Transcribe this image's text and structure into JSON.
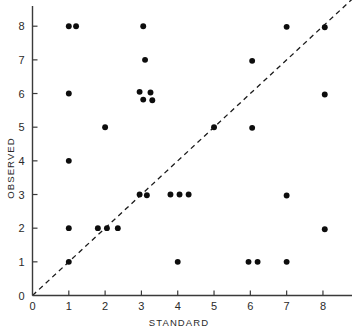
{
  "chart_data": {
    "type": "scatter",
    "title": "",
    "xlabel": "STANDARD",
    "ylabel": "OBSERVED",
    "xlim": [
      0,
      8.8
    ],
    "ylim": [
      0,
      8.6
    ],
    "xticks": [
      0,
      1,
      2,
      3,
      4,
      5,
      6,
      7,
      8
    ],
    "yticks": [
      0,
      1,
      2,
      3,
      4,
      5,
      6,
      7,
      8
    ],
    "xtick_labels": [
      "0",
      "1",
      "2",
      "3",
      "4",
      "5",
      "6",
      "7",
      "8"
    ],
    "ytick_labels": [
      "0",
      "1",
      "2",
      "3",
      "4",
      "5",
      "6",
      "7",
      "8"
    ],
    "grid": false,
    "legend": false,
    "marker": "filled-circle",
    "marker_color": "#0d0d0d",
    "marker_size": 5,
    "note": "points are jittered slightly to reveal overlapping observations",
    "reference_line": {
      "name": "identity-line",
      "style": "dashed",
      "color": "#1a1a1a",
      "from": [
        0,
        0
      ],
      "to": [
        8.8,
        8.8
      ],
      "equation": "y = x"
    },
    "x": [
      1.0,
      1.2,
      3.05,
      7.0,
      8.05,
      3.1,
      6.05,
      1.0,
      2.95,
      3.25,
      3.05,
      3.3,
      8.05,
      2.0,
      5.0,
      6.05,
      1.0,
      2.95,
      3.15,
      3.8,
      4.05,
      4.3,
      7.0,
      1.0,
      1.8,
      2.05,
      2.35,
      8.05,
      1.0,
      4.0,
      5.95,
      6.2,
      7.0
    ],
    "y": [
      8.0,
      8.0,
      8.0,
      7.98,
      7.97,
      7.0,
      6.97,
      6.0,
      6.05,
      6.03,
      5.82,
      5.8,
      5.97,
      5.0,
      5.0,
      4.98,
      4.0,
      3.0,
      2.98,
      3.0,
      3.0,
      3.0,
      2.97,
      2.0,
      2.0,
      2.0,
      2.0,
      1.97,
      1.0,
      1.0,
      1.0,
      1.0,
      1.0
    ],
    "points": [
      {
        "x": 1.0,
        "y": 8.0
      },
      {
        "x": 1.2,
        "y": 8.0
      },
      {
        "x": 3.05,
        "y": 8.0
      },
      {
        "x": 7.0,
        "y": 7.98
      },
      {
        "x": 8.05,
        "y": 7.97
      },
      {
        "x": 3.1,
        "y": 7.0
      },
      {
        "x": 6.05,
        "y": 6.97
      },
      {
        "x": 1.0,
        "y": 6.0
      },
      {
        "x": 2.95,
        "y": 6.05
      },
      {
        "x": 3.25,
        "y": 6.03
      },
      {
        "x": 3.05,
        "y": 5.82
      },
      {
        "x": 3.3,
        "y": 5.8
      },
      {
        "x": 8.05,
        "y": 5.97
      },
      {
        "x": 2.0,
        "y": 5.0
      },
      {
        "x": 5.0,
        "y": 5.0
      },
      {
        "x": 6.05,
        "y": 4.98
      },
      {
        "x": 1.0,
        "y": 4.0
      },
      {
        "x": 2.95,
        "y": 3.0
      },
      {
        "x": 3.15,
        "y": 2.98
      },
      {
        "x": 3.8,
        "y": 3.0
      },
      {
        "x": 4.05,
        "y": 3.0
      },
      {
        "x": 4.3,
        "y": 3.0
      },
      {
        "x": 7.0,
        "y": 2.97
      },
      {
        "x": 1.0,
        "y": 2.0
      },
      {
        "x": 1.8,
        "y": 2.0
      },
      {
        "x": 2.05,
        "y": 2.0
      },
      {
        "x": 2.35,
        "y": 2.0
      },
      {
        "x": 8.05,
        "y": 1.97
      },
      {
        "x": 1.0,
        "y": 1.0
      },
      {
        "x": 4.0,
        "y": 1.0
      },
      {
        "x": 5.95,
        "y": 1.0
      },
      {
        "x": 6.2,
        "y": 1.0
      },
      {
        "x": 7.0,
        "y": 1.0
      }
    ],
    "n_points": 33
  }
}
